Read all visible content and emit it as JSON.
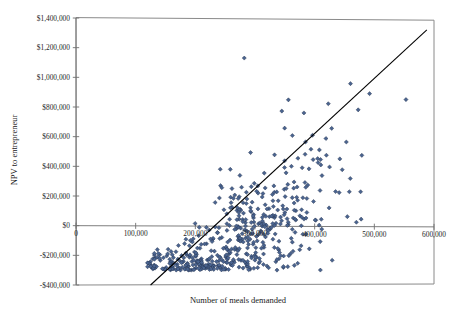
{
  "chart_data": {
    "type": "scatter",
    "title": "",
    "xlabel": "Number of meals demanded",
    "ylabel": "NPV to entrepreneur",
    "xlim": [
      0,
      600000
    ],
    "ylim": [
      -400000,
      1400000
    ],
    "grid": false,
    "legend": null,
    "x_ticks": [
      0,
      100000,
      200000,
      300000,
      400000,
      500000,
      600000
    ],
    "x_tick_labels": [
      "0",
      "100,000",
      "200,000",
      "300,000",
      "400,000",
      "500,000",
      "600,000"
    ],
    "y_ticks": [
      -400000,
      -200000,
      0,
      200000,
      400000,
      600000,
      800000,
      1000000,
      1200000,
      1400000
    ],
    "y_tick_labels": [
      "-$400,000",
      "-$200,000",
      "$0",
      "$200,000",
      "$400,000",
      "$600,000",
      "$800,000",
      "$1,000,000",
      "$1,200,000",
      "$1,400,000"
    ],
    "marker": {
      "shape": "diamond",
      "fill_color": "#4a6490",
      "edge_color": "#22304a",
      "size_px": 4.1,
      "count": 520
    },
    "reference_line": {
      "description": "diagonal break-even / regression line",
      "color": "#000000",
      "x_start": 125000,
      "y_start": -400000,
      "x_end": 588000,
      "y_end": 1320000
    },
    "zero_axis_line": {
      "y": 0,
      "color": "#6f6f6f"
    },
    "notable_points": [
      {
        "x": 282000,
        "y": 1130000,
        "note": "highest NPV outlier"
      },
      {
        "x": 553000,
        "y": 850000,
        "note": "far-right outlier"
      },
      {
        "x": 492000,
        "y": 890000,
        "note": "right-side high outlier"
      },
      {
        "x": 382000,
        "y": 760000,
        "note": "upper-right point"
      },
      {
        "x": 196000,
        "y": -265000,
        "note": "low-left negative point"
      }
    ],
    "distribution": {
      "x_mean": 263000,
      "x_sd": 82000,
      "y_intercept": -350000,
      "slope": 2.55,
      "residual_sd": 215000,
      "seed": 20240517
    }
  },
  "axis": {
    "x_title": "Number of meals demanded",
    "y_title": "NPV to entrepreneur"
  }
}
